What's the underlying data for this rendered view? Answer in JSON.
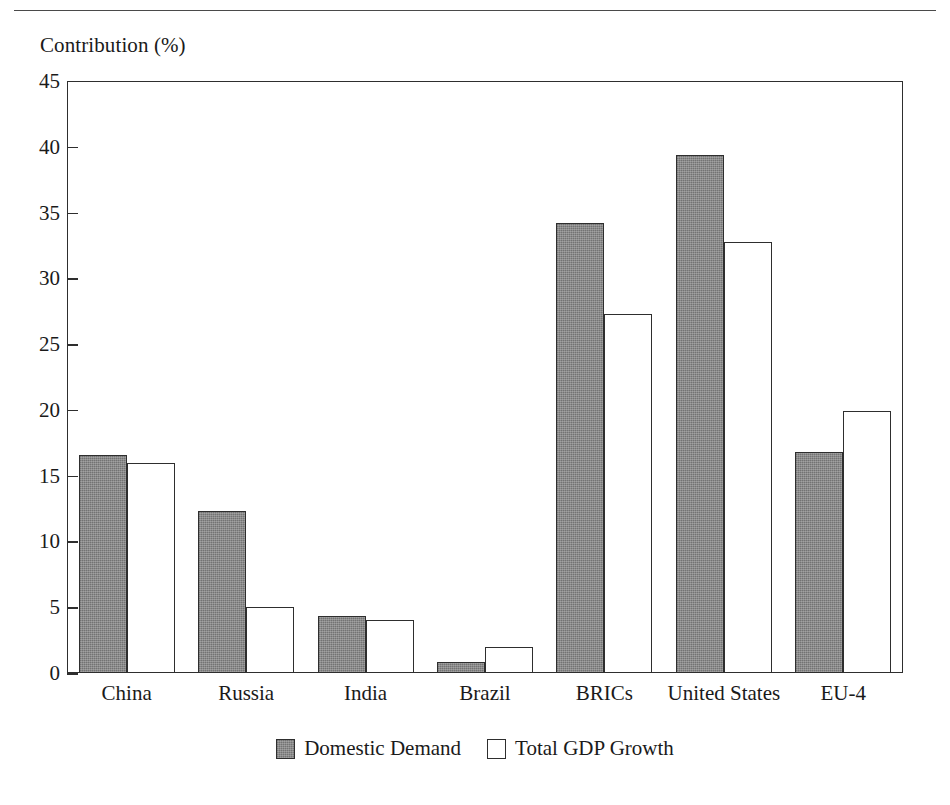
{
  "figure": {
    "y_axis_caption": "Contribution (%)"
  },
  "chart_data": {
    "type": "bar",
    "title": "",
    "xlabel": "",
    "ylabel": "Contribution (%)",
    "ylim": [
      0,
      45
    ],
    "yticks": [
      0,
      5,
      10,
      15,
      20,
      25,
      30,
      35,
      40,
      45
    ],
    "ytick_labels": [
      "0",
      "5",
      "10",
      "15",
      "20",
      "25",
      "30",
      "35",
      "40",
      "45"
    ],
    "grid": false,
    "legend_position": "bottom-center",
    "categories": [
      "China",
      "Russia",
      "India",
      "Brazil",
      "BRICs",
      "United States",
      "EU-4"
    ],
    "series": [
      {
        "name": "Domestic Demand",
        "color": "#808080",
        "values": [
          16.6,
          12.3,
          4.3,
          0.8,
          34.2,
          39.4,
          16.8
        ]
      },
      {
        "name": "Total GDP Growth",
        "color": "#ffffff",
        "values": [
          16.0,
          5.0,
          4.0,
          2.0,
          27.3,
          32.8,
          19.9
        ]
      }
    ]
  }
}
